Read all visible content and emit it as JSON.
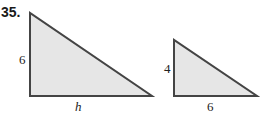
{
  "problem_number": "35.",
  "triangles": [
    {
      "name": "large-triangle",
      "vertical_leg_label": "6",
      "horizontal_leg_label": "h",
      "horizontal_label_italic": true
    },
    {
      "name": "small-triangle",
      "vertical_leg_label": "4",
      "horizontal_leg_label": "6",
      "horizontal_label_italic": false
    }
  ],
  "colors": {
    "fill": "#e6e6e6",
    "stroke": "#444444"
  }
}
